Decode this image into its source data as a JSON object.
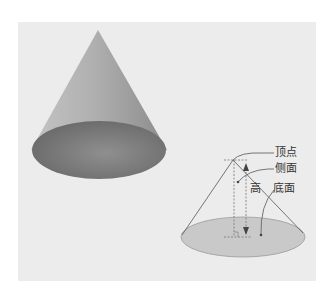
{
  "diagram": {
    "labels": {
      "apex": "顶点",
      "lateral_surface": "侧面",
      "height": "高",
      "base": "底面"
    },
    "colors": {
      "panel_background": "#ececec",
      "solid_cone_side": "#a8a8a8",
      "solid_cone_base": "#808080",
      "outline_base_fill": "#c8c8c8",
      "line": "#666666"
    }
  }
}
